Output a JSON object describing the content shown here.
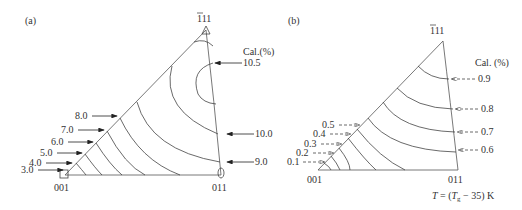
{
  "panel_a": {
    "label": "(a)",
    "pole_top": "111",
    "pole_left": "001",
    "pole_right": "011",
    "legend_title": "Cal.(%)",
    "left_values": [
      "8.0",
      "7.0",
      "6.0",
      "5.0",
      "4.0",
      "3.0"
    ],
    "right_values": [
      "10.5",
      "10.0",
      "9.0"
    ],
    "arrow_style": "solid"
  },
  "panel_b": {
    "label": "(b)",
    "pole_top": "111",
    "pole_left": "001",
    "pole_right": "011",
    "legend_title": "Cal. (%)",
    "left_values": [
      "0.5",
      "0.4",
      "0.3",
      "0.2",
      "0.1"
    ],
    "right_values": [
      "0.9",
      "0.8",
      "0.7",
      "0.6"
    ],
    "arrow_style": "dashed",
    "caption_T": "T",
    "caption_eq": " = (",
    "caption_Tg": "T",
    "caption_sub": "g",
    "caption_rest": " − 35) K"
  }
}
